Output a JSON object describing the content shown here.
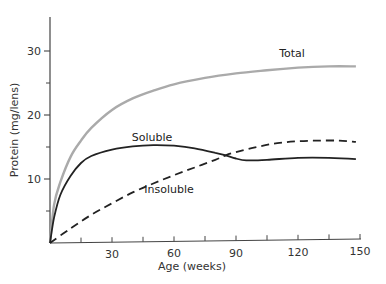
{
  "chart_data": {
    "type": "line",
    "title": "",
    "xlabel": "Age (weeks)",
    "ylabel": "Protein (mg/lens)",
    "xlim": [
      0,
      150
    ],
    "ylim": [
      0,
      35
    ],
    "x_ticks": [
      30,
      60,
      90,
      120,
      150
    ],
    "x_minor_ticks": [
      15,
      45,
      75,
      105,
      135
    ],
    "y_ticks": [
      10,
      20,
      30
    ],
    "y_minor_ticks": [
      5,
      15,
      25
    ],
    "grid": false,
    "legend": "inline labels",
    "series": [
      {
        "name": "Total",
        "style": "solid",
        "color": "#aaaaaa",
        "x": [
          0,
          2,
          5,
          10,
          15,
          20,
          30,
          40,
          50,
          60,
          75,
          90,
          105,
          120,
          135,
          148
        ],
        "values": [
          0,
          6,
          9.5,
          13.5,
          16,
          18,
          20.8,
          22.6,
          23.8,
          24.8,
          25.8,
          26.5,
          27,
          27.4,
          27.6,
          27.6
        ]
      },
      {
        "name": "Soluble",
        "style": "solid",
        "color": "#222222",
        "x": [
          0,
          2,
          5,
          10,
          15,
          20,
          30,
          40,
          50,
          60,
          70,
          80,
          85,
          90,
          95,
          105,
          120,
          135,
          148
        ],
        "values": [
          0,
          4,
          7.5,
          10.5,
          12.5,
          13.6,
          14.6,
          15.1,
          15.3,
          15.2,
          14.8,
          14.1,
          13.7,
          13.2,
          12.9,
          13,
          13.3,
          13.3,
          13.1
        ]
      },
      {
        "name": "Insoluble",
        "style": "dashed",
        "color": "#222222",
        "x": [
          0,
          10,
          20,
          30,
          40,
          50,
          60,
          70,
          80,
          85,
          90,
          100,
          110,
          120,
          130,
          140,
          148
        ],
        "values": [
          0,
          2.3,
          4.4,
          6.2,
          7.9,
          9.3,
          10.6,
          11.8,
          13,
          13.7,
          14.2,
          15,
          15.6,
          15.9,
          16,
          16,
          15.8
        ]
      }
    ],
    "annotations": [
      {
        "text": "Total",
        "x": 117,
        "y": 28.5
      },
      {
        "text": "Soluble",
        "x": 40,
        "y": 16.2
      },
      {
        "text": "Insoluble",
        "x": 53,
        "y": 10.5
      }
    ]
  },
  "axes": {
    "xlabel": "Age (weeks)",
    "ylabel": "Protein (mg/lens)",
    "x_tick_labels": [
      "30",
      "60",
      "90",
      "120",
      "150"
    ],
    "y_tick_labels": [
      "10",
      "20",
      "30"
    ]
  },
  "labels": {
    "total": "Total",
    "soluble": "Soluble",
    "insoluble": "Insoluble"
  }
}
